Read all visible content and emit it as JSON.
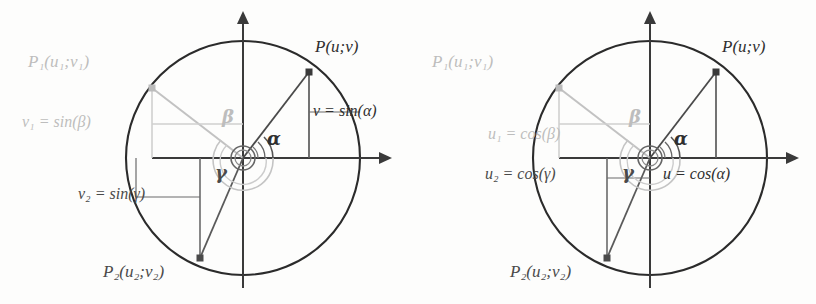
{
  "figure": {
    "type": "diagram",
    "panels": [
      {
        "id": "left-panel",
        "topic": "sine",
        "origin": {
          "x": 243,
          "y": 158
        },
        "radius": 117,
        "axes": {
          "x_arrow_tip_x": 383,
          "y_arrow_tip_y": 14
        },
        "points": [
          {
            "name": "P",
            "label": "P(u;v)",
            "angle_deg": 45,
            "x": 309,
            "y": 72,
            "color": "#2f2f2f",
            "tone": "dark"
          },
          {
            "name": "P1",
            "label": "P₁(u₁;v₁)",
            "angle_deg": 141,
            "x": 152,
            "y": 88,
            "color": "#bdbdbd",
            "tone": "light"
          },
          {
            "name": "P2",
            "label": "P₂(u₂;v₂)",
            "angle_deg": 249,
            "x": 200,
            "y": 258,
            "color": "#4a4a4a",
            "tone": "mid"
          }
        ],
        "angles": [
          {
            "symbol": "α",
            "name": "alpha",
            "tone": "dark"
          },
          {
            "symbol": "β",
            "name": "beta",
            "tone": "light"
          },
          {
            "symbol": "γ",
            "name": "gamma",
            "tone": "mid"
          }
        ],
        "value_labels": [
          {
            "id": "v-alpha",
            "text": "v = sin(α)",
            "var": "v",
            "fn": "sin",
            "arg": "α",
            "tone": "dark"
          },
          {
            "id": "v1-beta",
            "text": "v₁ = sin(β)",
            "var": "v₁",
            "fn": "sin",
            "arg": "β",
            "tone": "light"
          },
          {
            "id": "v2-gamma",
            "text": "v₂ = sin(γ)",
            "var": "v₂",
            "fn": "sin",
            "arg": "γ",
            "tone": "mid"
          }
        ]
      },
      {
        "id": "right-panel",
        "topic": "cosine",
        "origin": {
          "x": 650,
          "y": 158
        },
        "radius": 117,
        "axes": {
          "x_arrow_tip_x": 790,
          "y_arrow_tip_y": 14
        },
        "points": [
          {
            "name": "P",
            "label": "P(u;v)",
            "angle_deg": 45,
            "x": 716,
            "y": 72,
            "color": "#2f2f2f",
            "tone": "dark"
          },
          {
            "name": "P1",
            "label": "P₁(u₁;v₁)",
            "angle_deg": 141,
            "x": 559,
            "y": 88,
            "color": "#bdbdbd",
            "tone": "light"
          },
          {
            "name": "P2",
            "label": "P₂(u₂;v₂)",
            "angle_deg": 249,
            "x": 607,
            "y": 258,
            "color": "#4a4a4a",
            "tone": "mid"
          }
        ],
        "angles": [
          {
            "symbol": "α",
            "name": "alpha",
            "tone": "dark"
          },
          {
            "symbol": "β",
            "name": "beta",
            "tone": "light"
          },
          {
            "symbol": "γ",
            "name": "gamma",
            "tone": "mid"
          }
        ],
        "value_labels": [
          {
            "id": "u-alpha",
            "text": "u = cos(α)",
            "var": "u",
            "fn": "cos",
            "arg": "α",
            "tone": "dark"
          },
          {
            "id": "u1-beta",
            "text": "u₁ = cos(β)",
            "var": "u₁",
            "fn": "cos",
            "arg": "β",
            "tone": "light"
          },
          {
            "id": "u2-gamma",
            "text": "u₂ = cos(γ)",
            "var": "u₂",
            "fn": "cos",
            "arg": "γ",
            "tone": "mid"
          }
        ]
      }
    ],
    "colors": {
      "dark": "#2f2f2f",
      "mid": "#4a4a4a",
      "light": "#bdbdbd",
      "background": "#fdfdfc",
      "circle": "#2b2b2b"
    }
  },
  "left": {
    "p_label": "P(u;v)",
    "p1_label": "P₁(u₁;v₁)",
    "p2_label": "P₂(u₂;v₂)",
    "alpha": "α",
    "beta": "β",
    "gamma": "γ",
    "v_sin_alpha": "v = sin(α)",
    "v1_sin_beta": "v₁ = sin(β)",
    "v2_sin_gamma": "v₂ = sin(γ)"
  },
  "right": {
    "p_label": "P(u;v)",
    "p1_label": "P₁(u₁;v₁)",
    "p2_label": "P₂(u₂;v₂)",
    "alpha": "α",
    "beta": "β",
    "gamma": "γ",
    "u_cos_alpha": "u = cos(α)",
    "u1_cos_beta": "u₁ = cos(β)",
    "u2_cos_gamma": "u₂ = cos(γ)"
  }
}
